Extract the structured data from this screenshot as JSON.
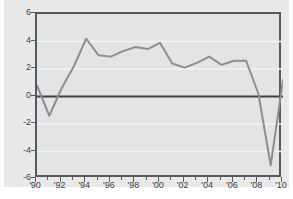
{
  "chart_data": {
    "type": "line",
    "title": "",
    "xlabel": "",
    "ylabel": "",
    "ylim": [
      -6,
      6
    ],
    "xlim": [
      1990,
      2010
    ],
    "yticks": [
      6,
      4,
      2,
      0,
      -2,
      -4,
      -6
    ],
    "ytick_labels": [
      "6",
      "4",
      "2",
      "0",
      "-2",
      "-4",
      "-6"
    ],
    "xticks": [
      1990,
      1992,
      1994,
      1996,
      1998,
      2000,
      2002,
      2004,
      2006,
      2008,
      2010
    ],
    "xtick_labels": [
      "'90",
      "'92",
      "'94",
      "'96",
      "'98",
      "'00",
      "'02",
      "'04",
      "'06",
      "'08",
      "'10"
    ],
    "xminor_ticks": [
      1991,
      1993,
      1995,
      1997,
      1999,
      2001,
      2003,
      2005,
      2007,
      2009
    ],
    "grid": "horizontal",
    "gridlines_at": [
      4,
      2,
      -2,
      -4
    ],
    "zero_line": 0,
    "legend": "none",
    "annotations": [],
    "x": [
      1990,
      1991,
      1992,
      1993,
      1994,
      1995,
      1996,
      1997,
      1998,
      1999,
      2000,
      2001,
      2002,
      2003,
      2004,
      2005,
      2006,
      2007,
      2008,
      2009,
      2010
    ],
    "series": [
      {
        "name": "",
        "color": "#8c8f92",
        "values": [
          0.8,
          -1.4,
          0.6,
          2.2,
          4.2,
          3.0,
          2.9,
          3.3,
          3.6,
          3.45,
          3.9,
          2.4,
          2.1,
          2.45,
          2.9,
          2.3,
          2.6,
          2.6,
          0.2,
          -5.0,
          1.2
        ]
      }
    ]
  },
  "colors": {
    "page_background": "#ffffff",
    "figure_background": "#e9e9e9",
    "plot_background": "#e4e4e4",
    "axis": "#555a5e",
    "gridline": "#f3f3f3",
    "zero_line": "#3a3f44",
    "series_line": "#8c8f92",
    "tick_text": "#3a3f44"
  }
}
